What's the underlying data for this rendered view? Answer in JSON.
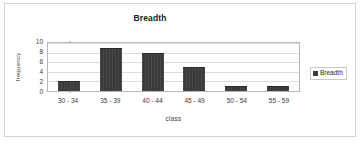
{
  "chart_data": {
    "type": "bar",
    "title": "Breadth",
    "xlabel": "class",
    "ylabel": "frequency",
    "categories": [
      "30 - 34",
      "35 - 39",
      "40 - 44",
      "45 - 49",
      "50 - 54",
      "55 - 59"
    ],
    "values": [
      2,
      9,
      8,
      5,
      1,
      1
    ],
    "series": [
      {
        "name": "Breadth",
        "values": [
          2,
          9,
          8,
          5,
          1,
          1
        ],
        "color": "#3a3a3a"
      }
    ],
    "ylim": [
      0,
      10
    ],
    "ytick_labels": [
      "10",
      "8",
      "6",
      "4",
      "2",
      "0"
    ],
    "ytick_values": [
      10,
      8,
      6,
      4,
      2,
      0
    ],
    "ytick_step": 2,
    "grid": "horizontal",
    "legend_position": "right",
    "legend_entries": [
      "Breadth"
    ]
  },
  "legend": {
    "swatch_icon": "legend-color-swatch-icon",
    "label": "Breadth"
  },
  "colors": {
    "bar": "#3a3a3a",
    "gridline": "#dcdcdc",
    "plot_border": "#b8b8b8",
    "frame_border": "#d2d2d2",
    "text": "#3c3c3c",
    "title_text": "#1d1d1d",
    "background": "#ffffff"
  }
}
